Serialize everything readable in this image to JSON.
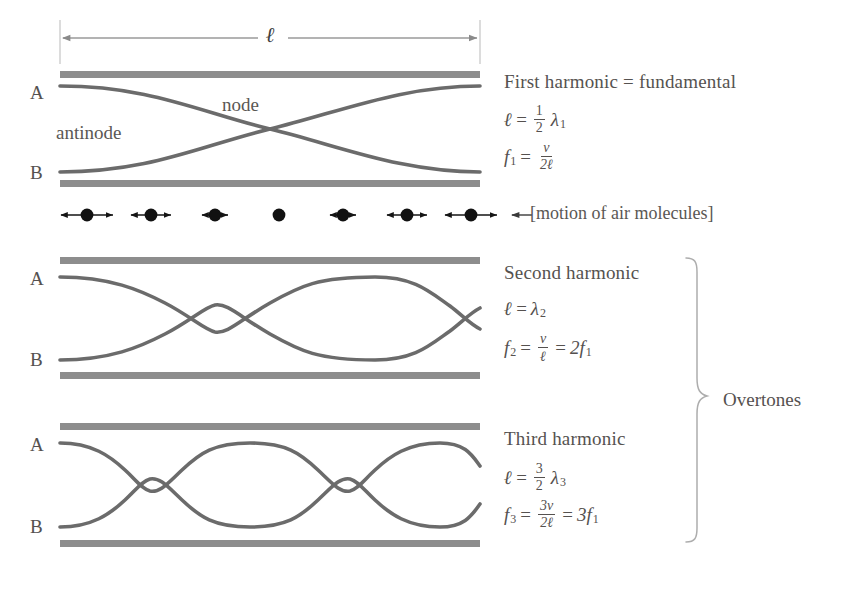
{
  "figure": {
    "title_alt": "Standing waves in a tube open at both ends",
    "length_symbol": "ℓ",
    "node_label": "node",
    "antinode_label": "antinode",
    "motion_label": "[motion of air molecules]",
    "overtones_label": "Overtones",
    "tube_labels": {
      "top": "A",
      "bottom": "B"
    },
    "colors": {
      "wall": "#8d8d8d",
      "wave": "#6b6b6b",
      "text": "#55514f",
      "molecule": "#111111",
      "dimension_line": "#9a9a9a"
    },
    "harmonics": [
      {
        "id": "first",
        "title": "First harmonic = fundamental",
        "nodes": 1,
        "wavelength_eq": {
          "lhs": "ℓ",
          "rel": "=",
          "num": "1",
          "den": "2",
          "sym": "λ",
          "sub": "1"
        },
        "frequency_eq": {
          "lhs": "f",
          "lhs_sub": "1",
          "rel": "=",
          "num": "v",
          "den": "2ℓ"
        },
        "top_label": "A",
        "bottom_label": "B"
      },
      {
        "id": "second",
        "title": "Second harmonic",
        "nodes": 2,
        "wavelength_eq": {
          "lhs": "ℓ",
          "rel": "=",
          "sym": "λ",
          "sub": "2"
        },
        "frequency_eq": {
          "lhs": "f",
          "lhs_sub": "2",
          "rel": "=",
          "num": "v",
          "den": "ℓ",
          "rel2": "=",
          "rhs": "2f",
          "rhs_sub": "1"
        },
        "top_label": "A",
        "bottom_label": "B"
      },
      {
        "id": "third",
        "title": "Third harmonic",
        "nodes": 3,
        "wavelength_eq": {
          "lhs": "ℓ",
          "rel": "=",
          "num": "3",
          "den": "2",
          "sym": "λ",
          "sub": "3"
        },
        "frequency_eq": {
          "lhs": "f",
          "lhs_sub": "3",
          "rel": "=",
          "num": "3v",
          "den": "2ℓ",
          "rel2": "=",
          "rhs": "3f",
          "rhs_sub": "1"
        },
        "top_label": "A",
        "bottom_label": "B"
      }
    ],
    "molecules": {
      "count": 7,
      "arrow_half_lengths": [
        26,
        20,
        13,
        0,
        13,
        20,
        26
      ],
      "description": "air molecule displacement amplitude, maximum at the open ends, zero at the central node"
    }
  }
}
